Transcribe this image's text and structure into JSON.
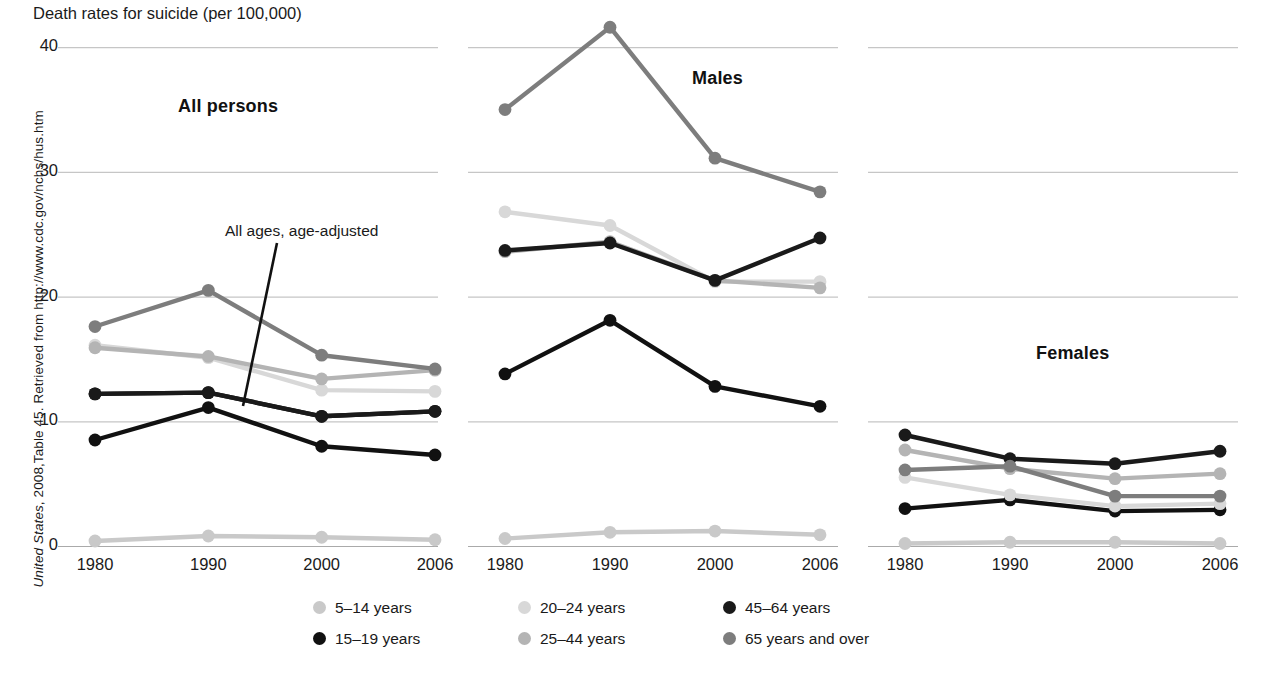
{
  "title": "Death rates for suicide (per 100,000)",
  "source_note": {
    "italic_part": "United States",
    "rest_part": ", 2008,Table 45.  Retrieved from http://www.cdc.gov/nchs/hus.htm"
  },
  "annotation": {
    "label": "All ages, age-adjusted"
  },
  "axis": {
    "y_ticks": [
      "0",
      "10",
      "20",
      "30",
      "40"
    ],
    "x_ticks": [
      "1980",
      "1990",
      "2000",
      "2006"
    ]
  },
  "legend": [
    {
      "label": "5–14 years",
      "color": "#c9c9c9"
    },
    {
      "label": "15–19 years",
      "color": "#111111"
    },
    {
      "label": "20–24 years",
      "color": "#d8d8d8"
    },
    {
      "label": "25–44 years",
      "color": "#b4b4b4"
    },
    {
      "label": "45–64 years",
      "color": "#1a1a1a"
    },
    {
      "label": "65 years and over",
      "color": "#7d7d7d"
    }
  ],
  "chart_data": {
    "type": "line",
    "title": "Death rates for suicide (per 100,000)",
    "xlabel": "",
    "ylabel": "Death rates for suicide (per 100,000)",
    "x": [
      "1980",
      "1990",
      "2000",
      "2006"
    ],
    "ylim": [
      0,
      42
    ],
    "y_ticks": [
      0,
      10,
      20,
      30,
      40
    ],
    "grid": true,
    "legend_position": "bottom",
    "panels": [
      {
        "name": "All persons",
        "series": [
          {
            "name": "5–14 years",
            "color": "#c9c9c9",
            "values": [
              0.4,
              0.8,
              0.7,
              0.5
            ]
          },
          {
            "name": "15–19 years",
            "color": "#111111",
            "values": [
              8.5,
              11.1,
              8.0,
              7.3
            ]
          },
          {
            "name": "20–24 years",
            "color": "#d8d8d8",
            "values": [
              16.1,
              15.1,
              12.5,
              12.4
            ]
          },
          {
            "name": "25–44 years",
            "color": "#b4b4b4",
            "values": [
              15.9,
              15.2,
              13.4,
              14.1
            ]
          },
          {
            "name": "45–64 years",
            "color": "#1a1a1a",
            "values": [
              12.2,
              12.3,
              10.4,
              10.8
            ]
          },
          {
            "name": "65 years and over",
            "color": "#7d7d7d",
            "values": [
              17.6,
              20.5,
              15.3,
              14.2
            ]
          },
          {
            "name": "All ages, age-adjusted",
            "color": "#1a1a1a",
            "values": [
              12.2,
              12.3,
              10.4,
              10.8
            ]
          }
        ]
      },
      {
        "name": "Males",
        "series": [
          {
            "name": "5–14 years",
            "color": "#c9c9c9",
            "values": [
              0.6,
              1.1,
              1.2,
              0.9
            ]
          },
          {
            "name": "15–19 years",
            "color": "#111111",
            "values": [
              13.8,
              18.1,
              12.8,
              11.2
            ]
          },
          {
            "name": "20–24 years",
            "color": "#d8d8d8",
            "values": [
              26.8,
              25.7,
              21.2,
              21.2
            ]
          },
          {
            "name": "25–44 years",
            "color": "#b4b4b4",
            "values": [
              23.6,
              24.4,
              21.3,
              20.7
            ]
          },
          {
            "name": "45–64 years",
            "color": "#1a1a1a",
            "values": [
              23.7,
              24.3,
              21.3,
              24.7
            ]
          },
          {
            "name": "65 years and over",
            "color": "#7d7d7d",
            "values": [
              35.0,
              41.6,
              31.1,
              28.4
            ]
          }
        ]
      },
      {
        "name": "Females",
        "series": [
          {
            "name": "5–14 years",
            "color": "#c9c9c9",
            "values": [
              0.2,
              0.3,
              0.3,
              0.2
            ]
          },
          {
            "name": "15–19 years",
            "color": "#111111",
            "values": [
              3.0,
              3.7,
              2.8,
              2.9
            ]
          },
          {
            "name": "20–24 years",
            "color": "#d8d8d8",
            "values": [
              5.5,
              4.1,
              3.2,
              3.4
            ]
          },
          {
            "name": "25–44 years",
            "color": "#b4b4b4",
            "values": [
              7.7,
              6.2,
              5.4,
              5.8
            ]
          },
          {
            "name": "45–64 years",
            "color": "#1a1a1a",
            "values": [
              8.9,
              7.0,
              6.6,
              7.6
            ]
          },
          {
            "name": "65 years and over",
            "color": "#7d7d7d",
            "values": [
              6.1,
              6.4,
              4.0,
              4.0
            ]
          }
        ]
      }
    ]
  },
  "geometry": {
    "y_zero_px": 546,
    "y_unit_px": 12.47,
    "panels": [
      {
        "x0": 95,
        "x1": 435,
        "title_x": 178,
        "title_y": 96
      },
      {
        "x0": 505,
        "x1": 820,
        "title_x": 692,
        "title_y": 68
      },
      {
        "x0": 905,
        "x1": 1220,
        "title_x": 1036,
        "title_y": 343
      }
    ],
    "grid_x0": 35,
    "grid_spans": [
      [
        58,
        438
      ],
      [
        468,
        838
      ],
      [
        868,
        1238
      ]
    ]
  }
}
